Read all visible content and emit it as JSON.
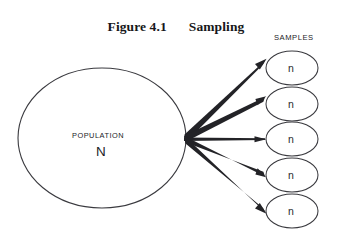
{
  "figure": {
    "number": "Figure 4.1",
    "name": "Sampling"
  },
  "population": {
    "label": "POPULATION",
    "symbol": "N"
  },
  "samples": {
    "heading": "SAMPLES",
    "items": [
      {
        "symbol": "n"
      },
      {
        "symbol": "n"
      },
      {
        "symbol": "n"
      },
      {
        "symbol": "n"
      },
      {
        "symbol": "n"
      }
    ]
  },
  "colors": {
    "stroke": "#3a3a3f",
    "arrow": "#232327",
    "text": "#17171a",
    "background": "#ffffff"
  },
  "diagram_data": {
    "type": "diagram",
    "title": "Figure 4.1 Sampling",
    "description": "A large ellipse labeled POPULATION N on the left, with five tapered arrows fanning out from its right edge to five small ellipses each labeled n on the right, grouped under the heading SAMPLES.",
    "nodes": [
      {
        "id": "population",
        "shape": "ellipse",
        "cx": 102,
        "cy": 138,
        "rx": 84,
        "ry": 70,
        "labels": [
          "POPULATION",
          "N"
        ]
      },
      {
        "id": "sample-1",
        "shape": "ellipse",
        "cx": 292,
        "cy": 68,
        "rx": 26,
        "ry": 17,
        "labels": [
          "n"
        ]
      },
      {
        "id": "sample-2",
        "shape": "ellipse",
        "cx": 292,
        "cy": 104,
        "rx": 26,
        "ry": 17,
        "labels": [
          "n"
        ]
      },
      {
        "id": "sample-3",
        "shape": "ellipse",
        "cx": 292,
        "cy": 139,
        "rx": 26,
        "ry": 17,
        "labels": [
          "n"
        ]
      },
      {
        "id": "sample-4",
        "shape": "ellipse",
        "cx": 292,
        "cy": 175,
        "rx": 26,
        "ry": 17,
        "labels": [
          "n"
        ]
      },
      {
        "id": "sample-5",
        "shape": "ellipse",
        "cx": 292,
        "cy": 211,
        "rx": 26,
        "ry": 17,
        "labels": [
          "n"
        ]
      }
    ],
    "edges": [
      {
        "from": "population",
        "to": "sample-1",
        "style": "tapered-arrow"
      },
      {
        "from": "population",
        "to": "sample-2",
        "style": "tapered-arrow"
      },
      {
        "from": "population",
        "to": "sample-3",
        "style": "tapered-arrow"
      },
      {
        "from": "population",
        "to": "sample-4",
        "style": "tapered-arrow"
      },
      {
        "from": "population",
        "to": "sample-5",
        "style": "tapered-arrow"
      }
    ]
  }
}
